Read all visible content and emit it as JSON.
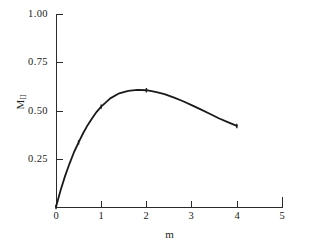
{
  "chart_data": {
    "type": "line",
    "title": "",
    "subtitle": "",
    "xlabel": "m",
    "ylabel": "M_II",
    "ylabel_base": "M",
    "ylabel_sub": "II",
    "xlim": [
      0,
      5
    ],
    "ylim": [
      0,
      1.0
    ],
    "grid": false,
    "legend": null,
    "x_ticks": [
      0,
      1,
      2,
      3,
      4,
      5
    ],
    "x_tick_labels": [
      "0",
      "1",
      "2",
      "3",
      "4",
      "5"
    ],
    "y_ticks": [
      0.25,
      0.5,
      0.75,
      1.0
    ],
    "y_tick_labels": [
      "0.25",
      "0.50",
      "0.75",
      "1.00"
    ],
    "series": [
      {
        "name": "M_II",
        "color": "#1a1a1a",
        "line_width": 1.8,
        "marker": "tick",
        "x": [
          0.0,
          0.1,
          0.2,
          0.3,
          0.4,
          0.5,
          0.6,
          0.7,
          0.8,
          0.9,
          1.0,
          1.2,
          1.4,
          1.6,
          1.8,
          2.0,
          2.2,
          2.4,
          2.6,
          2.8,
          3.0,
          3.2,
          3.4,
          3.6,
          3.8,
          4.0
        ],
        "y": [
          0.0,
          0.085,
          0.16,
          0.225,
          0.285,
          0.335,
          0.382,
          0.424,
          0.46,
          0.493,
          0.52,
          0.563,
          0.589,
          0.602,
          0.607,
          0.605,
          0.597,
          0.585,
          0.568,
          0.549,
          0.528,
          0.506,
          0.483,
          0.46,
          0.44,
          0.42
        ]
      }
    ],
    "marked_points": [
      {
        "x": 0.0,
        "y": 0.0
      },
      {
        "x": 0.5,
        "y": 0.335
      },
      {
        "x": 1.0,
        "y": 0.52
      },
      {
        "x": 2.0,
        "y": 0.605
      },
      {
        "x": 4.0,
        "y": 0.42
      }
    ]
  },
  "axes": {
    "y_labels": [
      "1.00",
      "0.75",
      "0.50",
      "0.25"
    ],
    "x_labels": [
      "0",
      "1",
      "2",
      "3",
      "4",
      "5"
    ],
    "x_title": "m",
    "y_title_base": "M",
    "y_title_sub": "II"
  },
  "colors": {
    "curve": "#1a1a1a",
    "axis": "#2b2b2b",
    "background": "#ffffff",
    "text": "#1a1a1a"
  }
}
